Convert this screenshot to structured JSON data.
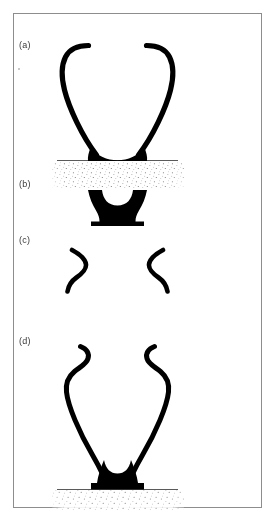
{
  "figure": {
    "domain": "Diagram",
    "background_color": "#ffffff",
    "ink_color": "#000000",
    "frame": {
      "border_color": "#8d8d8d",
      "x": 13,
      "y": 13,
      "width": 249,
      "height": 495
    },
    "panels": [
      {
        "id": "a",
        "label": "(a)",
        "label_x": 19,
        "label_y": 41,
        "description": "Wide open V-shaped pair of curved filaments with outward-hooked upper tips, joined at a filled wedge-shaped foot resting on a stippled granular surface",
        "has_ground_line": true,
        "has_stipple": true,
        "ground_line": {
          "x1": 57,
          "x2": 178,
          "y": 160
        }
      },
      {
        "id": "b",
        "label": "(b)",
        "label_x": 19,
        "label_y": 180,
        "description": "Isolated solid hourglass / anvil shaped foot with concave upper saddle and flared base",
        "has_ground_line": false,
        "has_stipple": false
      },
      {
        "id": "c",
        "label": "(c)",
        "label_x": 19,
        "label_y": 236,
        "description": "Two separated mirror-image S-curved filament segments, detached from each other and from any base",
        "has_ground_line": false,
        "has_stipple": false
      },
      {
        "id": "d",
        "label": "(d)",
        "label_x": 19,
        "label_y": 337,
        "description": "Tall narrow wishbone of two S-curved filaments with inward-then-outward hooked upper tips meeting at a solid flared foot on a stippled granular surface",
        "has_ground_line": true,
        "has_stipple": true,
        "ground_line": {
          "x1": 57,
          "x2": 178,
          "y": 489
        }
      }
    ],
    "colors": {
      "ink": "#000000",
      "frame_border": "#8d8d8d",
      "label_text": "#3a3a3a",
      "ground_line": "#5a5a5a",
      "stipple": "#6b6b6b",
      "page_background": "#ffffff"
    }
  }
}
